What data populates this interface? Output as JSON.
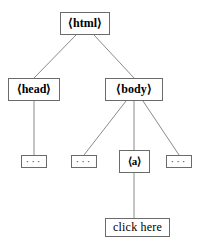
{
  "diagram": {
    "type": "dom-tree",
    "title": "",
    "line_color": "#8a8a8a",
    "border_color": "#6b6b6b",
    "text_color": "#000000",
    "background": "#ffffff",
    "nodes": [
      {
        "id": "html",
        "label": "⟨html⟩",
        "kind": "element",
        "level": 0
      },
      {
        "id": "head",
        "label": "⟨head⟩",
        "kind": "element",
        "level": 1
      },
      {
        "id": "body",
        "label": "⟨body⟩",
        "kind": "element",
        "level": 1
      },
      {
        "id": "head-ellipsis",
        "label": "···",
        "kind": "ellipsis",
        "level": 2
      },
      {
        "id": "body-ellipsis-1",
        "label": "···",
        "kind": "ellipsis",
        "level": 2
      },
      {
        "id": "a",
        "label": "⟨a⟩",
        "kind": "element",
        "level": 2
      },
      {
        "id": "body-ellipsis-2",
        "label": "···",
        "kind": "ellipsis",
        "level": 2
      },
      {
        "id": "clickhere",
        "label": "click here",
        "kind": "text",
        "level": 3
      }
    ],
    "edges": [
      {
        "from": "html",
        "to": "head"
      },
      {
        "from": "html",
        "to": "body"
      },
      {
        "from": "head",
        "to": "head-ellipsis"
      },
      {
        "from": "body",
        "to": "body-ellipsis-1"
      },
      {
        "from": "body",
        "to": "a"
      },
      {
        "from": "body",
        "to": "body-ellipsis-2"
      },
      {
        "from": "a",
        "to": "clickhere"
      }
    ]
  }
}
